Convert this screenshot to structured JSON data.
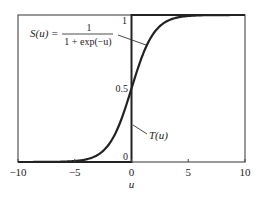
{
  "chart_data": {
    "type": "line",
    "title": "",
    "xlabel": "u",
    "ylabel": "",
    "xlim": [
      -10,
      10
    ],
    "ylim": [
      0,
      1
    ],
    "grid": false,
    "x_ticks": [
      -10,
      -5,
      0,
      5,
      10
    ],
    "x_tick_labels": [
      "−10",
      "−5",
      "0",
      "5",
      "10"
    ],
    "y_ticks": [
      0,
      0.5,
      1
    ],
    "y_tick_labels": [
      "0",
      "0.5",
      "1"
    ],
    "series": [
      {
        "name": "S(u)",
        "formula": "1 / (1 + exp(-u))",
        "kind": "sigmoid",
        "x": [
          -10,
          -8,
          -6,
          -5,
          -4,
          -3,
          -2,
          -1,
          0,
          1,
          2,
          3,
          4,
          5,
          6,
          8,
          10
        ],
        "values": [
          5e-05,
          0.0003,
          0.0025,
          0.0067,
          0.018,
          0.047,
          0.119,
          0.269,
          0.5,
          0.731,
          0.881,
          0.953,
          0.982,
          0.993,
          0.9975,
          0.9997,
          0.99995
        ]
      },
      {
        "name": "T(u)",
        "kind": "step",
        "x": [
          -10,
          0,
          0,
          10
        ],
        "values": [
          0,
          0,
          1,
          1
        ]
      }
    ],
    "annotations": [
      {
        "label": "S(u) = 1 / (1 + exp(−u))",
        "points_to": "S(u) curve near u≈0.7"
      },
      {
        "label": "T(u)",
        "points_to": "step at u=0"
      }
    ],
    "legend": "none (inline annotations)"
  },
  "labels": {
    "s_lhs": "S(u) =",
    "s_num": "1",
    "s_den": "1 + exp(−u)",
    "t_label": "T(u)",
    "xlabel": "u",
    "x_ticks": [
      "−10",
      "−5",
      "0",
      "5",
      "10"
    ],
    "y_ticks": [
      "0",
      "0.5",
      "1"
    ]
  },
  "colors": {
    "curve": "#222222",
    "frame": "#444444",
    "background": "#ffffff"
  }
}
